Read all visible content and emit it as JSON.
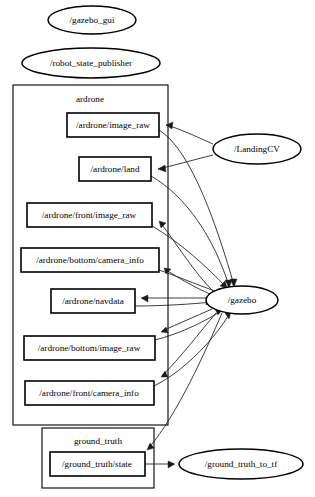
{
  "diagram": {
    "type": "node-topic-graph",
    "background_color": "#ffffff",
    "line_color": "#1a1a1a",
    "fill_color": "#ffffff"
  },
  "clusters": [
    {
      "id": "ardrone",
      "label": "ardrone",
      "x": 13,
      "y": 85,
      "w": 155,
      "h": 340,
      "label_x": 90,
      "label_y": 99
    },
    {
      "id": "ground_truth",
      "label": "ground_truth",
      "x": 42,
      "y": 428,
      "w": 112,
      "h": 60,
      "label_x": 98,
      "label_y": 441
    }
  ],
  "nodes": [
    {
      "id": "gazebo_gui",
      "label": "/gazebo_gui",
      "shape": "ellipse",
      "cx": 92,
      "cy": 20,
      "rx": 44,
      "ry": 14
    },
    {
      "id": "robot_state_publisher",
      "label": "/robot_state_publisher",
      "shape": "ellipse",
      "cx": 91,
      "cy": 63,
      "rx": 69,
      "ry": 15
    },
    {
      "id": "LandingCV",
      "label": "/LandingCV",
      "shape": "ellipse",
      "cx": 257,
      "cy": 149,
      "rx": 44,
      "ry": 15
    },
    {
      "id": "gazebo",
      "label": "/gazebo",
      "shape": "ellipse",
      "cx": 242,
      "cy": 300,
      "rx": 36,
      "ry": 14
    },
    {
      "id": "ground_truth_to_tf",
      "label": "/ground_truth_to_tf",
      "shape": "ellipse",
      "cx": 241,
      "cy": 464,
      "rx": 62,
      "ry": 15
    }
  ],
  "topics": [
    {
      "id": "image_raw",
      "label": "/ardrone/image_raw",
      "x": 67,
      "y": 113,
      "w": 92,
      "h": 24
    },
    {
      "id": "land",
      "label": "/ardrone/land",
      "x": 79,
      "y": 157,
      "w": 72,
      "h": 24
    },
    {
      "id": "front_image_raw",
      "label": "/ardrone/front/image_raw",
      "x": 27,
      "y": 203,
      "w": 125,
      "h": 24
    },
    {
      "id": "bottom_camera_info",
      "label": "/ardrone/bottom/camera_info",
      "x": 21,
      "y": 248,
      "w": 138,
      "h": 24
    },
    {
      "id": "navdata",
      "label": "/ardrone/navdata",
      "x": 51,
      "y": 289,
      "w": 84,
      "h": 24
    },
    {
      "id": "bottom_image_raw",
      "label": "/ardrone/bottom/image_raw",
      "x": 24,
      "y": 336,
      "w": 131,
      "h": 24
    },
    {
      "id": "front_camera_info",
      "label": "/ardrone/front/camera_info",
      "x": 25,
      "y": 381,
      "w": 129,
      "h": 24
    },
    {
      "id": "gt_state",
      "label": "/ground_truth/state",
      "x": 50,
      "y": 452,
      "w": 95,
      "h": 24
    }
  ],
  "edges": [
    {
      "from": "LandingCV",
      "to": "image_raw",
      "direction": "to-topic"
    },
    {
      "from": "LandingCV",
      "to": "land",
      "direction": "to-topic"
    },
    {
      "from": "image_raw",
      "to": "gazebo",
      "direction": "to-node"
    },
    {
      "from": "land",
      "to": "gazebo",
      "direction": "to-node"
    },
    {
      "from": "gazebo",
      "to": "front_image_raw",
      "direction": "to-topic"
    },
    {
      "from": "gazebo",
      "to": "bottom_camera_info",
      "direction": "to-topic"
    },
    {
      "from": "gazebo",
      "to": "navdata",
      "direction": "to-topic"
    },
    {
      "from": "gazebo",
      "to": "bottom_image_raw",
      "direction": "to-topic"
    },
    {
      "from": "gazebo",
      "to": "front_camera_info",
      "direction": "to-topic"
    },
    {
      "from": "gazebo",
      "to": "gt_state",
      "direction": "to-topic"
    },
    {
      "from": "front_image_raw",
      "to": "gazebo",
      "direction": "to-node"
    },
    {
      "from": "bottom_camera_info",
      "to": "gazebo",
      "direction": "to-node"
    },
    {
      "from": "navdata",
      "to": "gazebo",
      "direction": "to-node"
    },
    {
      "from": "bottom_image_raw",
      "to": "gazebo",
      "direction": "to-node"
    },
    {
      "from": "front_camera_info",
      "to": "gazebo",
      "direction": "to-node"
    },
    {
      "from": "gt_state",
      "to": "ground_truth_to_tf",
      "direction": "to-node"
    }
  ]
}
